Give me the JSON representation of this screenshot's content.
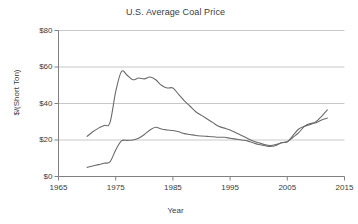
{
  "chart_data": {
    "type": "line",
    "title": "U.S. Average Coal Price",
    "xlabel": "Year",
    "ylabel": "$/(Short Ton)",
    "xlim": [
      1965,
      2015
    ],
    "ylim": [
      0,
      80
    ],
    "xticks": [
      1965,
      1975,
      1985,
      1995,
      2005,
      2015
    ],
    "xtick_labels": [
      "1965",
      "1975",
      "1985",
      "1995",
      "2005",
      "2015"
    ],
    "yticks": [
      0,
      20,
      40,
      60,
      80
    ],
    "ytick_labels": [
      "$0",
      "$20",
      "$40",
      "$60",
      "$80"
    ],
    "grid": "horizontal",
    "legend": "none",
    "line_color": "#6b6b6b",
    "grid_color": "#c8c8c8",
    "axis_color": "#808080",
    "series": [
      {
        "name": "Real (inflation-adjusted) price",
        "color": "#6b6b6b",
        "x": [
          1970,
          1971,
          1972,
          1973,
          1974,
          1975,
          1976,
          1977,
          1978,
          1979,
          1980,
          1981,
          1982,
          1983,
          1984,
          1985,
          1986,
          1987,
          1988,
          1989,
          1990,
          1991,
          1992,
          1993,
          1994,
          1995,
          1996,
          1997,
          1998,
          1999,
          2000,
          2001,
          2002,
          2003,
          2004,
          2005,
          2006,
          2007,
          2008,
          2009,
          2010,
          2011,
          2012
        ],
        "y": [
          22.0,
          24.5,
          26.5,
          28.0,
          29.5,
          46.5,
          57.5,
          55.5,
          53.0,
          54.0,
          53.5,
          54.5,
          53.0,
          50.0,
          48.5,
          48.5,
          45.0,
          41.5,
          38.5,
          35.5,
          33.5,
          31.5,
          29.5,
          27.5,
          26.5,
          25.5,
          24.0,
          22.5,
          21.0,
          19.5,
          18.5,
          17.5,
          17.0,
          17.5,
          18.5,
          19.0,
          22.5,
          26.0,
          27.5,
          28.5,
          30.0,
          33.0,
          36.5
        ]
      },
      {
        "name": "Nominal price",
        "color": "#6b6b6b",
        "x": [
          1970,
          1971,
          1972,
          1973,
          1974,
          1975,
          1976,
          1977,
          1978,
          1979,
          1980,
          1981,
          1982,
          1983,
          1984,
          1985,
          1986,
          1987,
          1988,
          1989,
          1990,
          1991,
          1992,
          1993,
          1994,
          1995,
          1996,
          1997,
          1998,
          1999,
          2000,
          2001,
          2002,
          2003,
          2004,
          2005,
          2006,
          2007,
          2008,
          2009,
          2010,
          2011,
          2012
        ],
        "y": [
          5.0,
          5.8,
          6.5,
          7.3,
          8.0,
          14.5,
          19.5,
          19.8,
          20.0,
          21.0,
          23.0,
          25.5,
          27.0,
          26.0,
          25.5,
          25.2,
          24.5,
          23.5,
          23.0,
          22.5,
          22.2,
          22.0,
          21.8,
          21.5,
          21.5,
          21.0,
          20.5,
          20.0,
          19.5,
          18.5,
          17.5,
          17.0,
          16.5,
          17.0,
          18.5,
          19.0,
          21.5,
          24.0,
          27.5,
          29.0,
          29.5,
          31.0,
          32.0
        ]
      }
    ]
  }
}
